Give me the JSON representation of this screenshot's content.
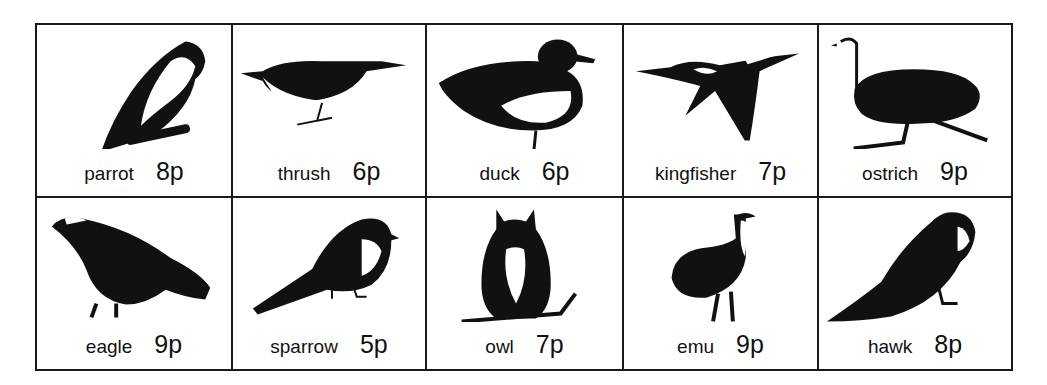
{
  "birds": [
    {
      "name": "parrot",
      "price": "8p",
      "icon": "parrot-icon"
    },
    {
      "name": "thrush",
      "price": "6p",
      "icon": "thrush-icon"
    },
    {
      "name": "duck",
      "price": "6p",
      "icon": "duck-icon"
    },
    {
      "name": "kingfisher",
      "price": "7p",
      "icon": "kingfisher-icon"
    },
    {
      "name": "ostrich",
      "price": "9p",
      "icon": "ostrich-icon"
    },
    {
      "name": "eagle",
      "price": "9p",
      "icon": "eagle-icon"
    },
    {
      "name": "sparrow",
      "price": "5p",
      "icon": "sparrow-icon"
    },
    {
      "name": "owl",
      "price": "7p",
      "icon": "owl-icon"
    },
    {
      "name": "emu",
      "price": "9p",
      "icon": "emu-icon"
    },
    {
      "name": "hawk",
      "price": "8p",
      "icon": "hawk-icon"
    }
  ],
  "colors": {
    "ink": "#111111",
    "paper": "#ffffff"
  }
}
